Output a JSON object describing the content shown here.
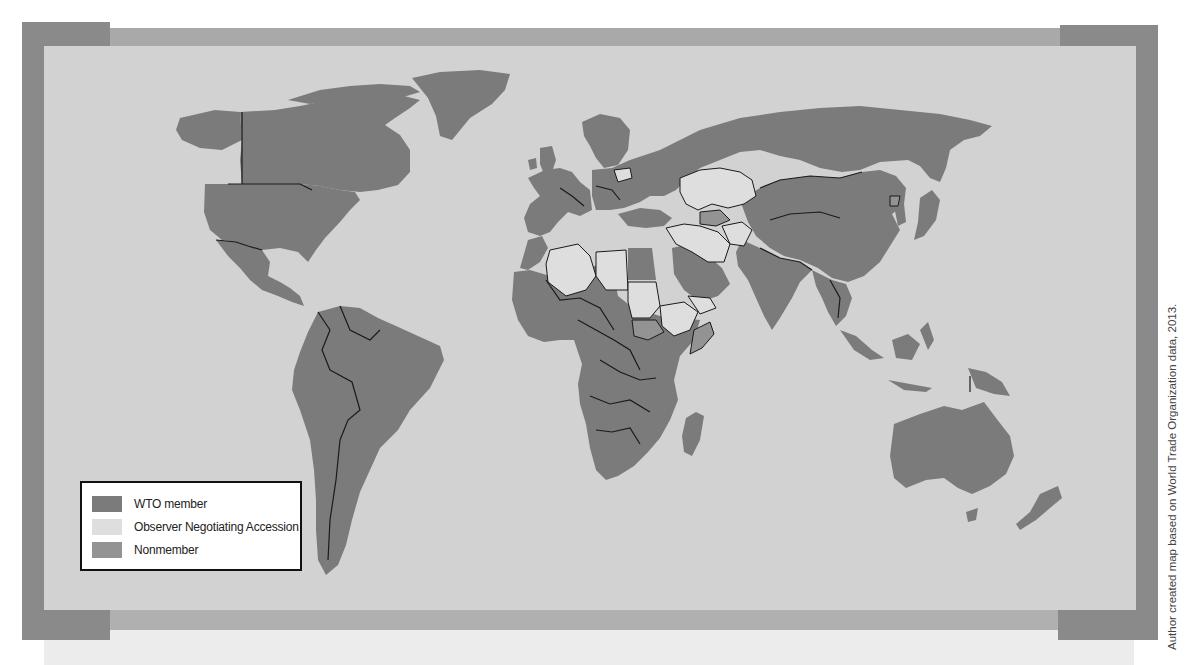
{
  "map": {
    "title": "World map of WTO membership status",
    "colors": {
      "ocean": "#d2d2d2",
      "wto_member": "#7b7b7b",
      "observer": "#dedede",
      "nonmember": "#939393",
      "border": "#1a1a1a",
      "frame_dark": "#8a8a8a",
      "frame_mid": "#a9a9a9"
    },
    "regions": {
      "wto_member": [
        "North America",
        "Central America",
        "South America",
        "Western Europe",
        "Eastern Europe",
        "Russia",
        "China",
        "Mongolia",
        "India",
        "Southeast Asia",
        "Japan",
        "Australia",
        "New Zealand",
        "Most of Sub-Saharan Africa",
        "Saudi Arabia",
        "Turkey",
        "Egypt",
        "Morocco",
        "Greenland"
      ],
      "observer": [
        "Kazakhstan",
        "Uzbekistan",
        "Iran",
        "Iraq",
        "Afghanistan",
        "Algeria",
        "Libya",
        "Sudan",
        "Ethiopia",
        "Belarus",
        "Syria",
        "Azerbaijan",
        "Lebanon"
      ],
      "nonmember": [
        "Turkmenistan",
        "South Sudan",
        "Eritrea",
        "Somalia",
        "North Korea"
      ]
    }
  },
  "legend": {
    "items": [
      {
        "label": "WTO member",
        "color": "#7b7b7b"
      },
      {
        "label": "Observer Negotiating Accession",
        "color": "#dedede"
      },
      {
        "label": "Nonmember",
        "color": "#939393"
      }
    ]
  },
  "credit": "Author created map based on World Trade Organization data, 2013."
}
